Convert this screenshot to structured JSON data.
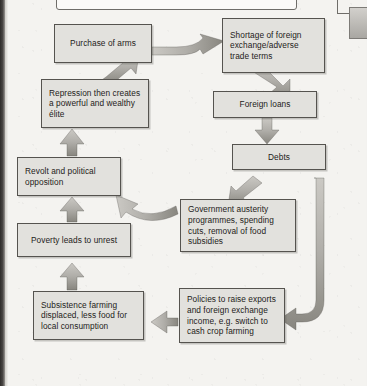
{
  "page": {
    "header_label": "The debt trap / cycle of debt",
    "background_color": "#f4f3f0",
    "box_fill_color": "#e2e1dd",
    "box_border_color": "#55534f",
    "arrow_fill_color": "#b3b1ac"
  },
  "diagram": {
    "type": "flowchart",
    "title": "The debt trap / cycle of debt",
    "nodes": [
      {
        "id": "purchase-of-arms",
        "label": "Purchase of arms"
      },
      {
        "id": "shortage-of-foreign-exchange",
        "label": "Shortage of foreign exchange/adverse trade terms"
      },
      {
        "id": "repression-creates-elite",
        "label": "Repression then creates a powerful and wealthy élite"
      },
      {
        "id": "foreign-loans",
        "label": "Foreign loans"
      },
      {
        "id": "debts",
        "label": "Debts"
      },
      {
        "id": "revolt-and-political-opposition",
        "label": "Revolt and political opposition"
      },
      {
        "id": "government-austerity",
        "label": "Government austerity programmes, spending cuts, removal of food subsidies"
      },
      {
        "id": "poverty-leads-to-unrest",
        "label": "Poverty leads to unrest"
      },
      {
        "id": "subsistence-farming-displaced",
        "label": "Subsistence farming displaced, less food for local consumption"
      },
      {
        "id": "policies-to-raise-exports",
        "label": "Policies to raise exports and foreign exchange income, e.g. switch to cash crop farming"
      }
    ],
    "edges": [
      {
        "from": "purchase-of-arms",
        "to": "shortage-of-foreign-exchange"
      },
      {
        "from": "shortage-of-foreign-exchange",
        "to": "foreign-loans"
      },
      {
        "from": "foreign-loans",
        "to": "debts"
      },
      {
        "from": "debts",
        "to": "government-austerity"
      },
      {
        "from": "debts",
        "to": "policies-to-raise-exports"
      },
      {
        "from": "government-austerity",
        "to": "revolt-and-political-opposition"
      },
      {
        "from": "policies-to-raise-exports",
        "to": "subsistence-farming-displaced"
      },
      {
        "from": "subsistence-farming-displaced",
        "to": "poverty-leads-to-unrest"
      },
      {
        "from": "poverty-leads-to-unrest",
        "to": "revolt-and-political-opposition"
      },
      {
        "from": "revolt-and-political-opposition",
        "to": "repression-creates-elite"
      },
      {
        "from": "repression-creates-elite",
        "to": "purchase-of-arms"
      }
    ]
  }
}
